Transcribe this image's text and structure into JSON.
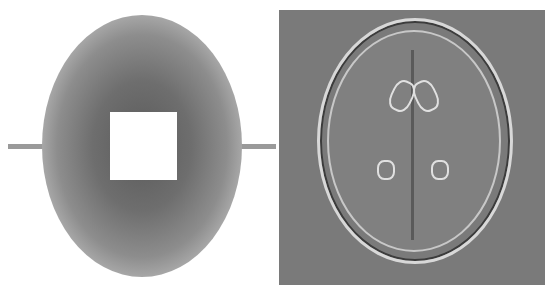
{
  "figure": {
    "left_panel": {
      "name": "k-space sampling pattern",
      "description": "Random undersampling mask with central fully-sampled square removed and horizontal line",
      "colors": {
        "background": "#ffffff",
        "samples": "#5a5a5a",
        "center": "#ffffff"
      }
    },
    "right_panel": {
      "name": "reconstructed brain MRI",
      "description": "Axial brain MRI slice, edge-enhanced reconstruction on gray background",
      "colors": {
        "background": "#7a7a7a",
        "edges": "#e0e0e0"
      }
    }
  }
}
